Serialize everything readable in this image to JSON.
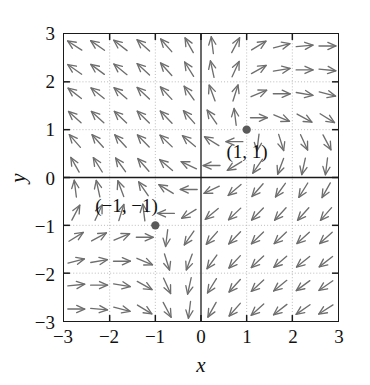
{
  "figure": {
    "kind": "vector-field-plot",
    "background_color": "#ffffff",
    "frame_color": "#1a1a1a",
    "arrow_color": "#6e6e6e",
    "grid_color": "#b4b4b4",
    "marker_color": "#5a5a5a",
    "text_color": "#111111"
  },
  "chart_data": {
    "type": "scatter",
    "subtype": "quiver-direction-field",
    "title": "",
    "xlabel": "x",
    "ylabel": "y",
    "xlim": [
      -3,
      3
    ],
    "ylim": [
      -3,
      3
    ],
    "xticks": [
      -3,
      -2,
      -1,
      0,
      1,
      2,
      3
    ],
    "yticks": [
      -3,
      -2,
      -1,
      0,
      1,
      2,
      3
    ],
    "xticklabels": [
      "−3",
      "−2",
      "−1",
      "0",
      "1",
      "2",
      "3"
    ],
    "yticklabels": [
      "−3",
      "−2",
      "−1",
      "0",
      "1",
      "2",
      "3"
    ],
    "grid": true,
    "grid_style": "dotted",
    "grid_at_integers": true,
    "axis_lines": {
      "x_axis_at_y": 0,
      "y_axis_at_x": 0,
      "style": "solid"
    },
    "legend": null,
    "arrow_grid": {
      "x_start": -2.75,
      "x_end": 2.75,
      "y_start": -2.75,
      "y_end": 2.75,
      "step": 0.5,
      "count_x": 12,
      "count_y": 12,
      "normalized_length_px": 17
    },
    "field": {
      "description": "direction field with equilibria at (1, 1) and (-1, -1)",
      "u_expression": "x*y - 1",
      "v_expression": "-(x - y)"
    },
    "annotations": [
      {
        "name": "equilibrium-point-1-1",
        "label": "(1, 1)",
        "x": 1,
        "y": 1,
        "marker": "filled-circle",
        "label_offset_x": 0.0,
        "label_offset_y": -0.45,
        "label_align": "center"
      },
      {
        "name": "equilibrium-point-neg1-neg1",
        "label": "(−1, −1)",
        "x": -1,
        "y": -1,
        "marker": "filled-circle",
        "label_offset_x": -0.62,
        "label_offset_y": 0.42,
        "label_align": "center"
      }
    ]
  }
}
